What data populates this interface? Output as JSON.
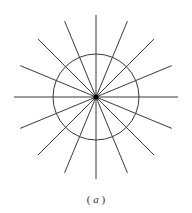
{
  "diagram": {
    "caption_open": "(",
    "caption_letter": "a",
    "caption_close": ")",
    "center": [
      96,
      97
    ],
    "circle_radius": 43,
    "ray_length": 82,
    "ray_count": 16,
    "stroke_color": "#3a3a3a",
    "center_dot_color": "#000000"
  }
}
